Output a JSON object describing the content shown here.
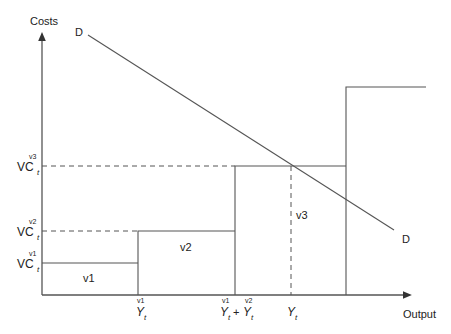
{
  "diagram": {
    "type": "step-cost-vs-demand",
    "y_axis_label": "Costs",
    "x_axis_label": "Output",
    "demand_label_start": "D",
    "demand_label_end": "D",
    "y_ticks": [
      {
        "main": "VC",
        "sub": "t",
        "sup": "v1"
      },
      {
        "main": "VC",
        "sub": "t",
        "sup": "v2"
      },
      {
        "main": "VC",
        "sub": "t",
        "sup": "v3"
      }
    ],
    "x_ticks": [
      {
        "parts": [
          {
            "main": "Y",
            "sub": "t",
            "sup": "v1"
          }
        ]
      },
      {
        "parts": [
          {
            "main": "Y",
            "sub": "t",
            "sup": "v1"
          },
          {
            "op": "+"
          },
          {
            "main": "Y",
            "sub": "t",
            "sup": "v2"
          }
        ]
      },
      {
        "parts": [
          {
            "main": "Y",
            "sub": "t",
            "sup": ""
          }
        ]
      }
    ],
    "regions": [
      "v1",
      "v2",
      "v3"
    ]
  }
}
